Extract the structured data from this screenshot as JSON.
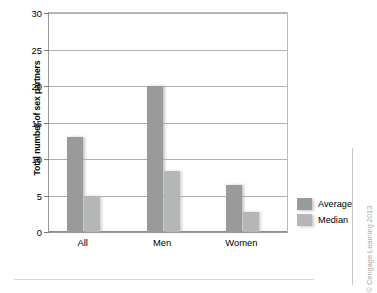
{
  "chart_data": {
    "type": "bar",
    "title": "",
    "xlabel": "",
    "ylabel": "Total number of sex partners",
    "categories": [
      "All",
      "Men",
      "Women"
    ],
    "series": [
      {
        "name": "Average",
        "values": [
          13,
          20,
          6.5
        ],
        "color": "#999a9a"
      },
      {
        "name": "Median",
        "values": [
          5,
          8.3,
          2.7
        ],
        "color": "#b5b6b6"
      }
    ],
    "ylim": [
      0,
      30
    ],
    "ytick_values": [
      0,
      5,
      10,
      15,
      20,
      25,
      30
    ],
    "ytick_labels": [
      "0",
      "5",
      "10",
      "15",
      "20",
      "25",
      "30"
    ],
    "grid": true,
    "grid_axis": "y",
    "legend_position": "right",
    "legend_entries": [
      "Average",
      "Median"
    ]
  },
  "credit": {
    "text": "© Cengage Learning 2013"
  },
  "artifact": {
    "bleed_text": ""
  }
}
